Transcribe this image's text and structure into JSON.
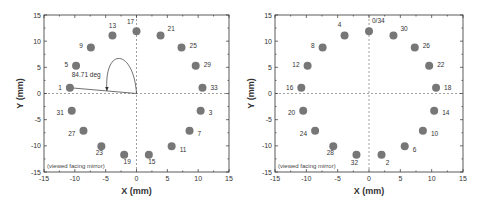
{
  "chart_data": [
    {
      "type": "scatter",
      "title": "",
      "xlabel": "X (mm)",
      "ylabel": "Y (mm)",
      "xlim": [
        -15,
        15
      ],
      "ylim": [
        -15,
        15
      ],
      "xticks": [
        -15,
        -10,
        -5,
        0,
        5,
        10,
        15
      ],
      "yticks": [
        -15,
        -10,
        -5,
        0,
        5,
        10,
        15
      ],
      "grid": false,
      "reference_lines": [
        "x=0 dashed",
        "y=0 dashed"
      ],
      "annotation": "(viewed facing mirror)",
      "angle_annotation": "84.71 deg",
      "points": [
        {
          "label": "33",
          "x": 10.7,
          "y": 1.1
        },
        {
          "label": "29",
          "x": 9.6,
          "y": 5.3
        },
        {
          "label": "25",
          "x": 7.3,
          "y": 8.8
        },
        {
          "label": "21",
          "x": 3.9,
          "y": 11.1
        },
        {
          "label": "17",
          "x": 0.0,
          "y": 11.9
        },
        {
          "label": "13",
          "x": -3.9,
          "y": 11.1
        },
        {
          "label": "9",
          "x": -7.4,
          "y": 8.8
        },
        {
          "label": "5",
          "x": -9.8,
          "y": 5.3
        },
        {
          "label": "1",
          "x": -10.8,
          "y": 1.1
        },
        {
          "label": "31",
          "x": -10.5,
          "y": -3.3
        },
        {
          "label": "27",
          "x": -8.6,
          "y": -7.1
        },
        {
          "label": "23",
          "x": -5.7,
          "y": -10.1
        },
        {
          "label": "19",
          "x": -2.0,
          "y": -11.7
        },
        {
          "label": "15",
          "x": 2.0,
          "y": -11.7
        },
        {
          "label": "11",
          "x": 5.7,
          "y": -10.1
        },
        {
          "label": "7",
          "x": 8.6,
          "y": -7.1
        },
        {
          "label": "3",
          "x": 10.4,
          "y": -3.3
        }
      ]
    },
    {
      "type": "scatter",
      "title": "",
      "xlabel": "X (mm)",
      "ylabel": "Y (mm)",
      "xlim": [
        -15,
        15
      ],
      "ylim": [
        -15,
        15
      ],
      "xticks": [
        -15,
        -10,
        -5,
        0,
        5,
        10,
        15
      ],
      "yticks": [
        -15,
        -10,
        -5,
        0,
        5,
        10,
        15
      ],
      "grid": false,
      "reference_lines": [
        "x=0 dashed",
        "y=0 dashed"
      ],
      "annotation": "(viewed facing mirror)",
      "points": [
        {
          "label": "0/34",
          "x": 0.0,
          "y": 11.9
        },
        {
          "label": "30",
          "x": 3.9,
          "y": 11.1
        },
        {
          "label": "26",
          "x": 7.3,
          "y": 8.8
        },
        {
          "label": "22",
          "x": 9.6,
          "y": 5.3
        },
        {
          "label": "18",
          "x": 10.7,
          "y": 1.1
        },
        {
          "label": "14",
          "x": 10.4,
          "y": -3.3
        },
        {
          "label": "10",
          "x": 8.6,
          "y": -7.1
        },
        {
          "label": "6",
          "x": 5.7,
          "y": -10.1
        },
        {
          "label": "2",
          "x": 2.0,
          "y": -11.7
        },
        {
          "label": "32",
          "x": -2.0,
          "y": -11.7
        },
        {
          "label": "28",
          "x": -5.7,
          "y": -10.1
        },
        {
          "label": "24",
          "x": -8.6,
          "y": -7.1
        },
        {
          "label": "20",
          "x": -10.5,
          "y": -3.3
        },
        {
          "label": "16",
          "x": -10.8,
          "y": 1.1
        },
        {
          "label": "12",
          "x": -9.8,
          "y": 5.3
        },
        {
          "label": "8",
          "x": -7.4,
          "y": 8.8
        },
        {
          "label": "4",
          "x": -3.9,
          "y": 11.1
        }
      ]
    }
  ],
  "left": {
    "xlabel": "X (mm)",
    "ylabel": "Y (mm)",
    "note": "(viewed facing mirror)",
    "angle": "84.71 deg"
  },
  "right": {
    "xlabel": "X (mm)",
    "ylabel": "Y (mm)",
    "note": "(viewed facing mirror)"
  },
  "colors": {
    "dot": "#777777",
    "axis": "#333333"
  }
}
